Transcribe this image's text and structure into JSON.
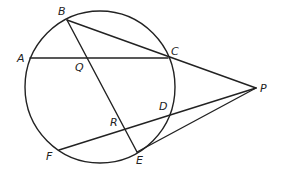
{
  "diagram": {
    "type": "geometry",
    "colors": {
      "stroke": "#222222",
      "background": "#ffffff"
    },
    "circle": {
      "cx": 100,
      "cy": 87,
      "rx": 75,
      "ry": 76
    },
    "points": {
      "A": {
        "x": 30,
        "y": 58,
        "label": "A",
        "lx": 17,
        "ly": 62
      },
      "B": {
        "x": 67,
        "y": 20,
        "label": "B",
        "lx": 58,
        "ly": 15
      },
      "C": {
        "x": 168,
        "y": 58,
        "label": "C",
        "lx": 171,
        "ly": 55
      },
      "D": {
        "x": 168,
        "y": 114,
        "label": "D",
        "lx": 159,
        "ly": 110
      },
      "E": {
        "x": 137,
        "y": 152,
        "label": "E",
        "lx": 136,
        "ly": 164
      },
      "F": {
        "x": 59,
        "y": 150,
        "label": "F",
        "lx": 46,
        "ly": 160
      },
      "P": {
        "x": 256,
        "y": 88,
        "label": "P",
        "lx": 260,
        "ly": 92
      },
      "Q": {
        "x": 86,
        "y": 58,
        "label": "Q",
        "lx": 75,
        "ly": 71
      },
      "R": {
        "x": 124,
        "y": 129,
        "label": "R",
        "lx": 110,
        "ly": 126
      }
    },
    "segments": [
      {
        "name": "chord-AC",
        "from": "A",
        "to": "C"
      },
      {
        "name": "segment-BE",
        "from": "B",
        "to": "E"
      },
      {
        "name": "secant-BP",
        "from": "B",
        "to": "P"
      },
      {
        "name": "secant-FP",
        "from": "F",
        "to": "P"
      },
      {
        "name": "tangent-EP",
        "from": "E",
        "to": "P"
      },
      {
        "name": "segment-CP",
        "from": "C",
        "to": "P"
      }
    ]
  }
}
